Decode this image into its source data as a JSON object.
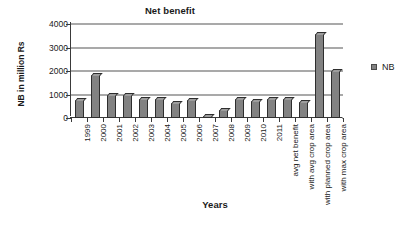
{
  "chart_data": {
    "type": "bar",
    "title": "Net benefit",
    "xlabel": "Years",
    "ylabel": "NB in million Rs",
    "ylim": [
      0,
      4000
    ],
    "ytick_values": [
      0,
      1000,
      2000,
      3000,
      4000
    ],
    "ytick_labels": [
      "0",
      "1000",
      "2000",
      "3000",
      "4000"
    ],
    "grid": true,
    "legend_position": "right",
    "categories": [
      "1999",
      "2000",
      "2001",
      "2002",
      "2003",
      "2004",
      "2005",
      "2006",
      "2007",
      "2008",
      "2009",
      "2010",
      "2011",
      "avg net benefit",
      "with avg crop area",
      "with planned crop area",
      "with max crop area"
    ],
    "series": [
      {
        "name": "NB",
        "color": "#828282",
        "values": [
          780,
          1830,
          980,
          980,
          800,
          820,
          640,
          760,
          100,
          350,
          820,
          730,
          790,
          790,
          700,
          3560,
          2000
        ]
      }
    ]
  },
  "legend": {
    "entries": [
      {
        "label": "NB",
        "color": "#828282"
      }
    ]
  }
}
